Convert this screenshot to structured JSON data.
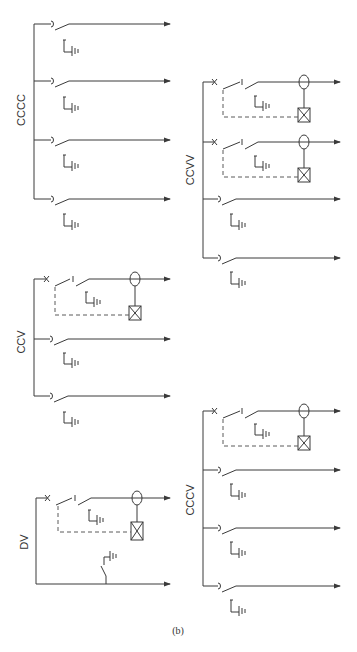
{
  "figure": {
    "caption": "(b)",
    "line_color": "#3a3a3a",
    "background": "#ffffff"
  },
  "panels": [
    {
      "id": "cccc",
      "label": "CCCC",
      "feeders": [
        {
          "type": "disconnector",
          "earth": true
        },
        {
          "type": "disconnector",
          "earth": true
        },
        {
          "type": "disconnector",
          "earth": true
        },
        {
          "type": "disconnector",
          "earth": true
        }
      ]
    },
    {
      "id": "ccvv",
      "label": "CCVV",
      "feeders": [
        {
          "type": "breaker-with-ct-and-relay",
          "earth": true
        },
        {
          "type": "breaker-with-ct-and-relay",
          "earth": true
        },
        {
          "type": "disconnector",
          "earth": true
        },
        {
          "type": "disconnector",
          "earth": true
        }
      ]
    },
    {
      "id": "ccv",
      "label": "CCV",
      "feeders": [
        {
          "type": "breaker-with-ct-and-relay",
          "earth": true
        },
        {
          "type": "disconnector",
          "earth": true
        },
        {
          "type": "disconnector",
          "earth": true
        }
      ]
    },
    {
      "id": "cccv",
      "label": "CCCV",
      "feeders": [
        {
          "type": "breaker-with-ct-and-relay",
          "earth": true
        },
        {
          "type": "disconnector",
          "earth": true
        },
        {
          "type": "disconnector",
          "earth": true
        },
        {
          "type": "disconnector",
          "earth": true
        }
      ]
    },
    {
      "id": "dv",
      "label": "DV",
      "feeders": [
        {
          "type": "breaker-with-ct-and-relay",
          "earth": true
        },
        {
          "type": "plain-with-earthing-switch",
          "earth": true
        }
      ]
    }
  ],
  "icons": {
    "disconnector": "disconnector-switch-icon",
    "breaker": "circuit-breaker-icon",
    "ct": "current-transformer-icon",
    "relay": "protection-relay-icon",
    "earth": "earthing-switch-icon",
    "arrow": "outgoing-arrow-icon"
  }
}
